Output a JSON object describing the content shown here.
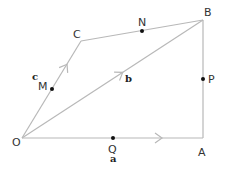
{
  "diagram": {
    "type": "vector-geometry-quadrilateral",
    "points": {
      "O": {
        "label": "O",
        "x": 22,
        "y": 138
      },
      "A": {
        "label": "A",
        "x": 203,
        "y": 138
      },
      "B": {
        "label": "B",
        "x": 203,
        "y": 20
      },
      "C": {
        "label": "C",
        "x": 81,
        "y": 41
      },
      "M": {
        "label": "M",
        "x": 52,
        "y": 89
      },
      "N": {
        "label": "N",
        "x": 142,
        "y": 31
      },
      "P": {
        "label": "P",
        "x": 203,
        "y": 79
      },
      "Q": {
        "label": "Q",
        "x": 113,
        "y": 138
      }
    },
    "edges": [
      {
        "from": "O",
        "to": "A",
        "arrow": true
      },
      {
        "from": "A",
        "to": "B",
        "arrow": false
      },
      {
        "from": "B",
        "to": "C",
        "arrow": false
      },
      {
        "from": "C",
        "to": "O",
        "arrow": false
      },
      {
        "from": "O",
        "to": "C",
        "arrow": true
      },
      {
        "from": "O",
        "to": "B",
        "arrow": true
      }
    ],
    "vectors": {
      "a": {
        "label": "a",
        "edge": "OA"
      },
      "b": {
        "label": "b",
        "edge": "OB"
      },
      "c": {
        "label": "c",
        "edge": "OC"
      }
    },
    "midpoints": [
      {
        "point": "M",
        "on": "OC"
      },
      {
        "point": "N",
        "on": "CB"
      },
      {
        "point": "P",
        "on": "AB"
      },
      {
        "point": "Q",
        "on": "OA"
      }
    ],
    "colors": {
      "line": "#b8b8b8",
      "dot": "#111111",
      "label": "#333333"
    }
  }
}
